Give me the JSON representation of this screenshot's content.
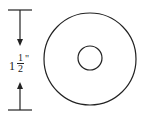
{
  "diagram": {
    "type": "dimensioned washer drawing",
    "dimension": {
      "whole": "1",
      "numerator": "1",
      "denominator": "2",
      "unit": "\"",
      "full_text": "1 1/2\""
    },
    "shapes": {
      "outer_circle": {
        "cx": 90,
        "cy": 59,
        "r": 46
      },
      "inner_circle": {
        "cx": 90,
        "cy": 58,
        "r": 12
      }
    },
    "stroke_color": "#222222"
  }
}
